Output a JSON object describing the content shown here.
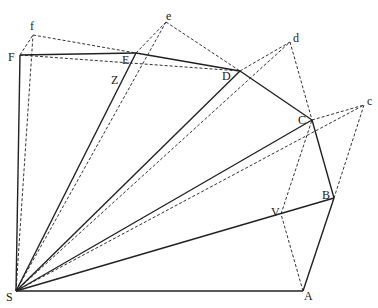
{
  "diagram": {
    "points": {
      "S": [
        16,
        291
      ],
      "A": [
        303,
        291
      ],
      "B": [
        334,
        198
      ],
      "C": [
        312,
        120
      ],
      "D": [
        240,
        71
      ],
      "E": [
        136,
        53
      ],
      "F": [
        20,
        55
      ],
      "f": [
        33,
        35
      ],
      "e": [
        166,
        22
      ],
      "d": [
        290,
        42
      ],
      "c": [
        364,
        105
      ],
      "Z": [
        138,
        72
      ],
      "V": [
        281,
        214
      ]
    },
    "labels": [
      {
        "text": "S",
        "x": 6,
        "y": 291
      },
      {
        "text": "A",
        "x": 304,
        "y": 290
      },
      {
        "text": "B",
        "x": 322,
        "y": 189
      },
      {
        "text": "V",
        "x": 271,
        "y": 206
      },
      {
        "text": "C",
        "x": 298,
        "y": 114
      },
      {
        "text": "c",
        "x": 367,
        "y": 95
      },
      {
        "text": "D",
        "x": 222,
        "y": 70
      },
      {
        "text": "d",
        "x": 293,
        "y": 32
      },
      {
        "text": "E",
        "x": 122,
        "y": 54
      },
      {
        "text": "e",
        "x": 166,
        "y": 10
      },
      {
        "text": "Z",
        "x": 111,
        "y": 74
      },
      {
        "text": "F",
        "x": 8,
        "y": 51
      },
      {
        "text": "f",
        "x": 30,
        "y": 20
      }
    ],
    "solid_segments": [
      [
        "S",
        "A"
      ],
      [
        "A",
        "B"
      ],
      [
        "B",
        "C"
      ],
      [
        "C",
        "D"
      ],
      [
        "D",
        "E"
      ],
      [
        "E",
        "F"
      ],
      [
        "F",
        "S"
      ],
      [
        "S",
        "B"
      ],
      [
        "S",
        "C"
      ],
      [
        "S",
        "D"
      ],
      [
        "S",
        "E"
      ]
    ],
    "dashed_segments": [
      [
        "S",
        "f"
      ],
      [
        "S",
        "e"
      ],
      [
        "S",
        "d"
      ],
      [
        "S",
        "c"
      ],
      [
        "F",
        "f"
      ],
      [
        "f",
        "E"
      ],
      [
        "E",
        "e"
      ],
      [
        "e",
        "D"
      ],
      [
        "D",
        "d"
      ],
      [
        "d",
        "C"
      ],
      [
        "C",
        "c"
      ],
      [
        "c",
        "B"
      ],
      [
        "F",
        "D"
      ],
      [
        "A",
        "V"
      ],
      [
        "V",
        "C"
      ]
    ]
  }
}
